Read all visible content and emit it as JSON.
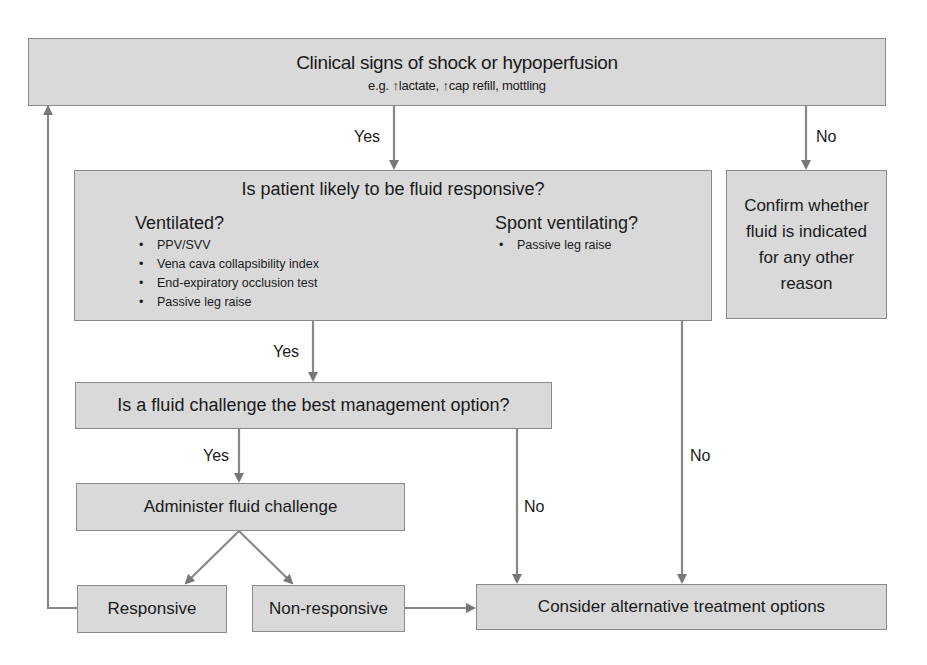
{
  "flowchart": {
    "start": {
      "title": "Clinical signs of shock or hypoperfusion",
      "subtitle": "e.g. ↑lactate, ↑cap refill, mottling"
    },
    "fluid_responsive": {
      "question": "Is patient likely to be fluid responsive?",
      "ventilated": {
        "heading": "Ventilated?",
        "items": [
          "PPV/SVV",
          "Vena cava collapsibility index",
          "End-expiratory occlusion test",
          "Passive leg raise"
        ]
      },
      "spont": {
        "heading": "Spont ventilating?",
        "items": [
          "Passive leg raise"
        ]
      }
    },
    "confirm": {
      "text": "Confirm whether fluid is indicated for any other reason"
    },
    "best_option": {
      "question": "Is a fluid challenge the best management option?"
    },
    "administer": {
      "text": "Administer fluid challenge"
    },
    "responsive": {
      "text": "Responsive"
    },
    "non_responsive": {
      "text": "Non-responsive"
    },
    "alternative": {
      "text": "Consider alternative treatment options"
    },
    "edge_labels": {
      "start_yes": "Yes",
      "start_no": "No",
      "responsive_yes": "Yes",
      "responsive_no": "No",
      "best_yes": "Yes",
      "best_no": "No"
    },
    "colors": {
      "box_fill": "#d9d9d9",
      "box_border": "#8a8a8a",
      "arrow": "#777777",
      "text": "#1a1a1a"
    }
  }
}
